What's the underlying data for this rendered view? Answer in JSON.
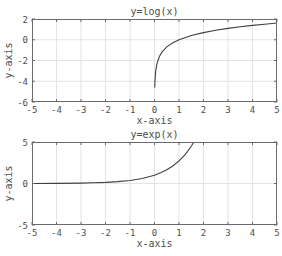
{
  "chart_data": [
    {
      "type": "line",
      "title": "y=log(x)",
      "xlabel": "x-axis",
      "ylabel": "y-axis",
      "xlim": [
        -5,
        5
      ],
      "ylim": [
        -6,
        2
      ],
      "xticks": [
        -5,
        -4,
        -3,
        -2,
        -1,
        0,
        1,
        2,
        3,
        4,
        5
      ],
      "yticks": [
        -6,
        -4,
        -2,
        0,
        2
      ],
      "xtick_labels": [
        "-5",
        "-4",
        "-3",
        "-2",
        "-1",
        "0",
        "1",
        "2",
        "3",
        "4",
        "5"
      ],
      "ytick_labels": [
        "-6",
        "-4",
        "-2",
        "0",
        "2"
      ],
      "grid": true,
      "series": [
        {
          "name": "log(x)",
          "x": [
            0.01,
            0.02,
            0.05,
            0.1,
            0.2,
            0.3,
            0.5,
            0.75,
            1,
            1.5,
            2,
            2.5,
            3,
            3.5,
            4,
            4.5,
            5
          ],
          "y": [
            -4.61,
            -3.91,
            -3.0,
            -2.3,
            -1.61,
            -1.2,
            -0.69,
            -0.29,
            0,
            0.41,
            0.69,
            0.92,
            1.1,
            1.25,
            1.39,
            1.5,
            1.61
          ]
        }
      ],
      "box": {
        "left": 32,
        "top": 19,
        "right": 277,
        "bottom": 102
      }
    },
    {
      "type": "line",
      "title": "y=exp(x)",
      "xlabel": "x-axis",
      "ylabel": "y-axis",
      "xlim": [
        -5,
        5
      ],
      "ylim": [
        -5,
        5
      ],
      "xticks": [
        -5,
        -4,
        -3,
        -2,
        -1,
        0,
        1,
        2,
        3,
        4,
        5
      ],
      "yticks": [
        -5,
        0,
        5
      ],
      "xtick_labels": [
        "-5",
        "-4",
        "-3",
        "-2",
        "-1",
        "0",
        "1",
        "2",
        "3",
        "4",
        "5"
      ],
      "ytick_labels": [
        "-5",
        "0",
        "5"
      ],
      "grid": true,
      "series": [
        {
          "name": "exp(x)",
          "x": [
            -5,
            -4,
            -3,
            -2.5,
            -2,
            -1.5,
            -1,
            -0.5,
            0,
            0.25,
            0.5,
            0.75,
            1,
            1.25,
            1.5,
            1.609
          ],
          "y": [
            0.0067,
            0.018,
            0.05,
            0.082,
            0.135,
            0.223,
            0.368,
            0.607,
            1.0,
            1.284,
            1.649,
            2.117,
            2.718,
            3.49,
            4.482,
            5.0
          ]
        }
      ],
      "box": {
        "left": 32,
        "top": 142,
        "right": 277,
        "bottom": 225
      }
    }
  ]
}
